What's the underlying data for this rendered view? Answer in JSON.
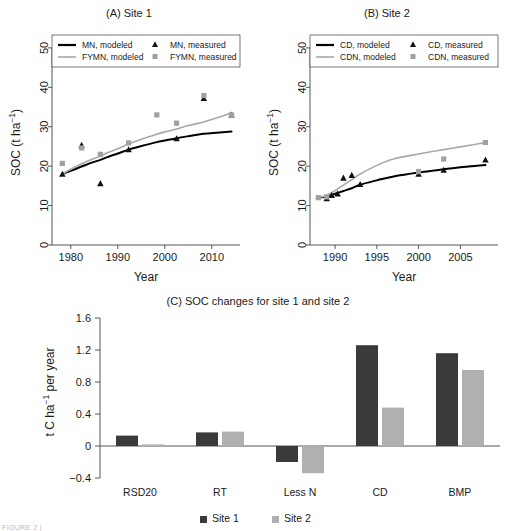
{
  "figure": {
    "caption_fragment": "FIGURE 2 |"
  },
  "panelA": {
    "title": "(A) Site 1",
    "xlabel": "Year",
    "ylabel": "SOC (t ha",
    "ylabel_sup": "−1",
    "ylabel_tail": ")",
    "legend": [
      {
        "label": "MN, modeled",
        "marker": "line-black"
      },
      {
        "label": "FYMN, modeled",
        "marker": "line-grey"
      },
      {
        "label": "MN, measured",
        "marker": "triangle-black"
      },
      {
        "label": "FYMN, measured",
        "marker": "square-grey"
      }
    ],
    "yticks": [
      "0",
      "10",
      "20",
      "30",
      "40",
      "50"
    ],
    "xticks": [
      "1980",
      "1990",
      "2000",
      "2010"
    ]
  },
  "panelB": {
    "title": "(B) Site 2",
    "xlabel": "Year",
    "ylabel": "SOC (t ha",
    "ylabel_sup": "−1",
    "ylabel_tail": ")",
    "legend": [
      {
        "label": "CD, modeled",
        "marker": "line-black"
      },
      {
        "label": "CDN, modeled",
        "marker": "line-grey"
      },
      {
        "label": "CD, measured",
        "marker": "triangle-black"
      },
      {
        "label": "CDN, measured",
        "marker": "square-grey"
      }
    ],
    "yticks": [
      "0",
      "10",
      "20",
      "30",
      "40",
      "50"
    ],
    "xticks": [
      "1990",
      "1995",
      "2000",
      "2005"
    ]
  },
  "panelC": {
    "title": "(C) SOC changes for site 1 and site 2",
    "ylabel_pre": "t C ha",
    "ylabel_sup": "−1",
    "ylabel_post": " per year",
    "yticks": [
      "-0.4",
      "0",
      "0.4",
      "0.8",
      "1.2",
      "1.6"
    ],
    "legend": [
      {
        "label": "Site 1",
        "color": "#3a3a3a"
      },
      {
        "label": "Site 2",
        "color": "#b0b0b0"
      }
    ]
  },
  "colors": {
    "modeled_black": "#000000",
    "modeled_grey": "#a8a8a8",
    "measured_black": "#111111",
    "measured_grey": "#a0a0a0",
    "bar_site1": "#3a3a3a",
    "bar_site2": "#b0b0b0",
    "axis": "#555555"
  },
  "chart_data": [
    {
      "type": "line",
      "id": "panel-a",
      "title": "(A) Site 1",
      "xlabel": "Year",
      "ylabel": "SOC (t ha−1)",
      "xlim": [
        1976,
        2016
      ],
      "ylim": [
        0,
        52
      ],
      "xticks": [
        1980,
        1990,
        2000,
        2010
      ],
      "yticks": [
        0,
        10,
        20,
        30,
        40,
        50
      ],
      "grid": false,
      "legend_position": "top-inside",
      "series": [
        {
          "name": "MN, modeled",
          "kind": "line",
          "color": "#000000",
          "x": [
            1978.2,
            1980,
            1982.3,
            1984,
            1986.3,
            1988,
            1990,
            1992.3,
            1995,
            1998.3,
            2000,
            2002.5,
            2005,
            2008.3,
            2011,
            2014.2
          ],
          "y": [
            18.0,
            18.8,
            19.9,
            20.7,
            21.6,
            22.4,
            23.2,
            24.2,
            25.1,
            26.1,
            26.5,
            27.1,
            27.6,
            28.2,
            28.5,
            28.8
          ]
        },
        {
          "name": "FYMN, modeled",
          "kind": "line",
          "color": "#a8a8a8",
          "x": [
            1978.2,
            1980,
            1982.3,
            1984,
            1986.3,
            1988,
            1990,
            1992.3,
            1995,
            1998.3,
            2000,
            2002.5,
            2005,
            2008.3,
            2011,
            2014.2
          ],
          "y": [
            18.0,
            19.2,
            20.6,
            21.5,
            22.6,
            23.5,
            24.4,
            25.6,
            26.8,
            28.1,
            28.7,
            29.4,
            30.3,
            31.2,
            32.2,
            33.5
          ]
        },
        {
          "name": "MN, measured",
          "kind": "scatter",
          "marker": "triangle",
          "color": "#111111",
          "x": [
            1978.2,
            1982.3,
            1986.3,
            1992.3,
            2002.5,
            2008.3,
            2014.2
          ],
          "y": [
            18.0,
            25.3,
            15.6,
            24.2,
            27.0,
            37.2,
            33.0
          ]
        },
        {
          "name": "FYMN, measured",
          "kind": "scatter",
          "marker": "square",
          "color": "#a0a0a0",
          "x": [
            1978.2,
            1982.3,
            1986.3,
            1992.3,
            1998.3,
            2002.5,
            2008.3,
            2014.2
          ],
          "y": [
            20.7,
            24.6,
            23.0,
            25.9,
            33.0,
            30.9,
            37.9,
            33.0
          ]
        }
      ]
    },
    {
      "type": "line",
      "id": "panel-b",
      "title": "(B) Site 2",
      "xlabel": "Year",
      "ylabel": "SOC (t ha−1)",
      "xlim": [
        1987,
        2009.5
      ],
      "ylim": [
        0,
        52
      ],
      "xticks": [
        1990,
        1995,
        2000,
        2005
      ],
      "yticks": [
        0,
        10,
        20,
        30,
        40,
        50
      ],
      "grid": false,
      "legend_position": "top-inside",
      "series": [
        {
          "name": "CD, modeled",
          "kind": "line",
          "color": "#000000",
          "x": [
            1988,
            1989,
            1990,
            1991,
            1992,
            1993,
            1995,
            1997,
            2000,
            2003,
            2005,
            2008
          ],
          "y": [
            12.0,
            12.3,
            13.0,
            13.7,
            14.4,
            15.3,
            16.4,
            17.4,
            18.4,
            19.2,
            19.7,
            20.3
          ]
        },
        {
          "name": "CDN, modeled",
          "kind": "line",
          "color": "#a8a8a8",
          "x": [
            1988,
            1989,
            1990,
            1991,
            1992,
            1993,
            1995,
            1997,
            2000,
            2003,
            2005,
            2008
          ],
          "y": [
            12.0,
            12.6,
            13.8,
            15.2,
            16.6,
            18.0,
            20.2,
            21.8,
            23.1,
            24.2,
            24.9,
            26.0
          ]
        },
        {
          "name": "CD, measured",
          "kind": "scatter",
          "marker": "triangle",
          "color": "#111111",
          "x": [
            1989,
            1989.6,
            1990.3,
            1991,
            1992,
            1993,
            2000,
            2003,
            2008
          ],
          "y": [
            11.8,
            12.6,
            13.0,
            17.0,
            17.7,
            15.4,
            18.0,
            19.0,
            21.6
          ]
        },
        {
          "name": "CDN, measured",
          "kind": "scatter",
          "marker": "square",
          "color": "#a0a0a0",
          "x": [
            1988,
            1989,
            2000,
            2003,
            2008
          ],
          "y": [
            12.0,
            12.2,
            18.6,
            21.8,
            26.0
          ]
        }
      ]
    },
    {
      "type": "bar",
      "id": "panel-c",
      "title": "(C) SOC changes for site 1 and site 2",
      "xlabel": "",
      "ylabel": "t C ha−1 per year",
      "categories": [
        "RSD20",
        "RT",
        "Less N",
        "CD",
        "BMP"
      ],
      "ylim": [
        -0.4,
        1.6
      ],
      "yticks": [
        -0.4,
        0,
        0.4,
        0.8,
        1.2,
        1.6
      ],
      "grid": false,
      "legend_position": "bottom",
      "series": [
        {
          "name": "Site 1",
          "color": "#3a3a3a",
          "values": [
            0.13,
            0.17,
            -0.2,
            1.26,
            1.16
          ]
        },
        {
          "name": "Site 2",
          "color": "#b0b0b0",
          "values": [
            0.02,
            0.18,
            -0.34,
            0.48,
            0.95
          ]
        }
      ]
    }
  ]
}
